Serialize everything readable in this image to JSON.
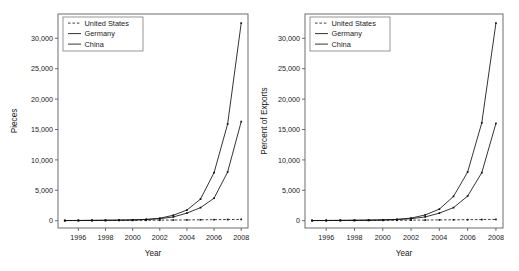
{
  "figure": {
    "background": "#ffffff",
    "axis_color": "#4a4a4a",
    "series_color": "#111111"
  },
  "chart_data": [
    {
      "id": "left",
      "type": "line",
      "title": "",
      "xlabel": "Year",
      "ylabel": "Pieces",
      "xlim": [
        1994.5,
        2008.5
      ],
      "ylim": [
        -1200,
        34000
      ],
      "grid": false,
      "legend_position": "top-left",
      "xticks": [
        1996,
        1998,
        2000,
        2002,
        2004,
        2006,
        2008
      ],
      "xtick_labels": [
        "1996",
        "1998",
        "2000",
        "2002",
        "2004",
        "2006",
        "2008"
      ],
      "yticks": [
        0,
        5000,
        10000,
        15000,
        20000,
        25000,
        30000
      ],
      "ytick_labels": [
        "0",
        "5,000",
        "10,000",
        "15,000",
        "20,000",
        "25,000",
        "30,000"
      ],
      "x": [
        1995,
        1996,
        1997,
        1998,
        1999,
        2000,
        2001,
        2002,
        2003,
        2004,
        2005,
        2006,
        2007,
        2008
      ],
      "series": [
        {
          "name": "United States",
          "style": "dashed",
          "values": [
            20,
            25,
            30,
            35,
            45,
            55,
            70,
            90,
            110,
            130,
            150,
            170,
            190,
            210
          ]
        },
        {
          "name": "Germany",
          "style": "solid",
          "values": [
            30,
            40,
            55,
            70,
            95,
            130,
            200,
            330,
            620,
            1250,
            2150,
            3700,
            8000,
            16300
          ]
        },
        {
          "name": "China",
          "style": "solid",
          "values": [
            25,
            35,
            50,
            65,
            90,
            125,
            210,
            400,
            900,
            1750,
            3550,
            7900,
            15900,
            32500
          ]
        }
      ]
    },
    {
      "id": "right",
      "type": "line",
      "title": "",
      "xlabel": "Year",
      "ylabel": "Percent of Exports",
      "xlim": [
        1994.5,
        2008.5
      ],
      "ylim": [
        -1200,
        34000
      ],
      "grid": false,
      "legend_position": "top-left",
      "xticks": [
        1996,
        1998,
        2000,
        2002,
        2004,
        2006,
        2008
      ],
      "xtick_labels": [
        "1996",
        "1998",
        "2000",
        "2002",
        "2004",
        "2006",
        "2008"
      ],
      "yticks": [
        0,
        5000,
        10000,
        15000,
        20000,
        25000,
        30000
      ],
      "ytick_labels": [
        "0",
        "5,000",
        "10,000",
        "15,000",
        "20,000",
        "25,000",
        "30,000"
      ],
      "x": [
        1995,
        1996,
        1997,
        1998,
        1999,
        2000,
        2001,
        2002,
        2003,
        2004,
        2005,
        2006,
        2007,
        2008
      ],
      "series": [
        {
          "name": "United States",
          "style": "dashed",
          "values": [
            20,
            25,
            30,
            35,
            45,
            55,
            70,
            90,
            110,
            130,
            150,
            170,
            190,
            210
          ]
        },
        {
          "name": "Germany",
          "style": "solid",
          "values": [
            30,
            40,
            55,
            70,
            95,
            130,
            200,
            330,
            620,
            1250,
            2150,
            4050,
            7900,
            16000
          ]
        },
        {
          "name": "China",
          "style": "solid",
          "values": [
            25,
            35,
            50,
            65,
            90,
            125,
            210,
            430,
            950,
            1900,
            4000,
            8000,
            16100,
            32500
          ]
        }
      ]
    }
  ],
  "legend": {
    "entries": [
      {
        "label": "United States",
        "style": "dashed"
      },
      {
        "label": "Germany",
        "style": "solid"
      },
      {
        "label": "China",
        "style": "solid"
      }
    ]
  }
}
